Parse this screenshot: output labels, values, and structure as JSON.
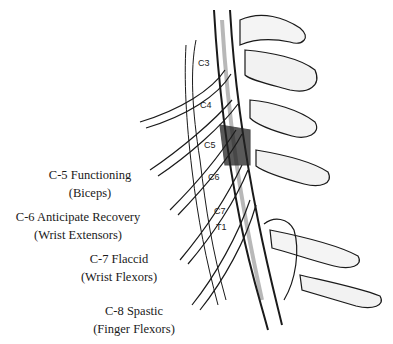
{
  "figure": {
    "vertebra_labels": [
      "C3",
      "C4",
      "C5",
      "C6",
      "C7",
      "T1"
    ],
    "annotations": [
      {
        "level": "C-5",
        "status": "Functioning",
        "line1": "C-5 Functioning",
        "line2": "(Biceps)"
      },
      {
        "level": "C-6",
        "status": "Anticipate Recovery",
        "line1": "C-6 Anticipate Recovery",
        "line2": "(Wrist Extensors)"
      },
      {
        "level": "C-7",
        "status": "Flaccid",
        "line1": "C-7 Flaccid",
        "line2": "(Wrist Flexors)"
      },
      {
        "level": "C-8",
        "status": "Spastic",
        "line1": "C-8 Spastic",
        "line2": "(Finger Flexors)"
      }
    ]
  }
}
